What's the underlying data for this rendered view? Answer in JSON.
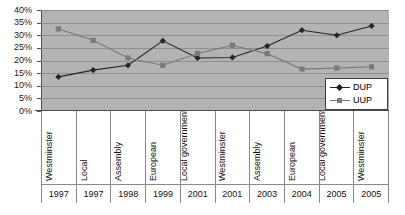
{
  "chart_data": {
    "type": "line",
    "title": "",
    "subtitle": "",
    "xlabel": "",
    "ylabel": "",
    "ylim": [
      0,
      40
    ],
    "ytick_values": [
      0,
      5,
      10,
      15,
      20,
      25,
      30,
      35,
      40
    ],
    "ytick_labels": [
      "0%",
      "5%",
      "10%",
      "15%",
      "20%",
      "25%",
      "30%",
      "35%",
      "40%"
    ],
    "grid": true,
    "legend_position": "inside bottom-right",
    "categories": [
      "Westminster 1997",
      "Local 1997",
      "Assembly 1998",
      "European 1999",
      "Local government 2001",
      "Westminster 2001",
      "Assembly 2003",
      "European 2004",
      "Local government 2005",
      "Westminster 2005"
    ],
    "category_rows": [
      {
        "election": "Westminster",
        "year": "1997"
      },
      {
        "election": "Local",
        "year": "1997"
      },
      {
        "election": "Assembly",
        "year": "1998"
      },
      {
        "election": "European",
        "year": "1999"
      },
      {
        "election": "Local government",
        "year": "2001"
      },
      {
        "election": "Westminster",
        "year": "2001"
      },
      {
        "election": "Assembly",
        "year": "2003"
      },
      {
        "election": "European",
        "year": "2004"
      },
      {
        "election": "Local government",
        "year": "2005"
      },
      {
        "election": "Westminster",
        "year": "2005"
      }
    ],
    "series": [
      {
        "name": "DUP",
        "marker": "diamond",
        "color": "#262626",
        "values": [
          13.5,
          16.2,
          18.1,
          27.8,
          21.0,
          21.2,
          25.7,
          32.0,
          30.0,
          33.7
        ]
      },
      {
        "name": "UUP",
        "marker": "square",
        "color": "#7a7a7a",
        "values": [
          32.5,
          28.0,
          21.0,
          18.1,
          22.8,
          26.0,
          22.7,
          16.6,
          17.0,
          17.5
        ]
      }
    ]
  },
  "legend": {
    "items": [
      {
        "label": "DUP",
        "marker": "diamond-marker",
        "color": "#262626"
      },
      {
        "label": "UUP",
        "marker": "square-marker",
        "color": "#7a7a7a"
      }
    ]
  },
  "colors": {
    "plot_background": "#b3b3b3",
    "gridline": "#8f8f8f",
    "axis": "#4d4d4d",
    "dup": "#262626",
    "uup": "#7a7a7a",
    "page_background": "#ffffff"
  }
}
